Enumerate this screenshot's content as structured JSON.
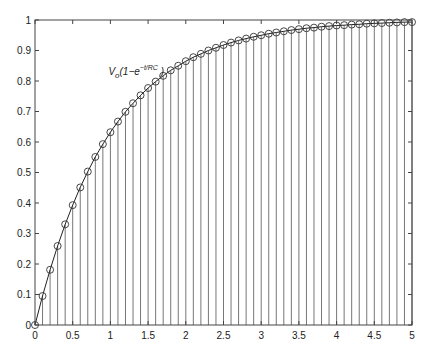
{
  "chart_data": {
    "type": "stem",
    "title": "",
    "xlabel": "",
    "ylabel": "",
    "xlim": [
      0,
      5
    ],
    "ylim": [
      0,
      1
    ],
    "grid": false,
    "legend": null,
    "x_ticks": [
      "0",
      "0.5",
      "1",
      "1.5",
      "2",
      "2.5",
      "3",
      "3.5",
      "4",
      "4.5",
      "5"
    ],
    "y_ticks": [
      "0",
      "0.1",
      "0.2",
      "0.3",
      "0.4",
      "0.5",
      "0.6",
      "0.7",
      "0.8",
      "0.9",
      "1"
    ],
    "annotation": {
      "base": "V",
      "sub": "o",
      "body": "(1−e",
      "sup": "−t/RC",
      "close": " )",
      "x": 1.0,
      "y": 0.82
    },
    "series": [
      {
        "name": "V_o(1-e^{-t/RC})",
        "style": "stem with circle markers and connecting line",
        "x": [
          0,
          0.1,
          0.2,
          0.3,
          0.4,
          0.5,
          0.6,
          0.7,
          0.8,
          0.9,
          1.0,
          1.1,
          1.2,
          1.3,
          1.4,
          1.5,
          1.6,
          1.7,
          1.8,
          1.9,
          2.0,
          2.1,
          2.2,
          2.3,
          2.4,
          2.5,
          2.6,
          2.7,
          2.8,
          2.9,
          3.0,
          3.1,
          3.2,
          3.3,
          3.4,
          3.5,
          3.6,
          3.7,
          3.8,
          3.9,
          4.0,
          4.1,
          4.2,
          4.3,
          4.4,
          4.5,
          4.6,
          4.7,
          4.8,
          4.9,
          5.0
        ],
        "values": [
          0.0,
          0.095,
          0.181,
          0.259,
          0.33,
          0.393,
          0.451,
          0.503,
          0.551,
          0.593,
          0.632,
          0.667,
          0.699,
          0.727,
          0.753,
          0.777,
          0.798,
          0.817,
          0.835,
          0.85,
          0.865,
          0.878,
          0.889,
          0.9,
          0.909,
          0.918,
          0.926,
          0.933,
          0.939,
          0.945,
          0.95,
          0.955,
          0.959,
          0.963,
          0.967,
          0.97,
          0.973,
          0.975,
          0.978,
          0.98,
          0.982,
          0.983,
          0.985,
          0.986,
          0.988,
          0.989,
          0.99,
          0.991,
          0.992,
          0.993,
          0.993
        ]
      }
    ]
  },
  "colors": {
    "axis": "#444444",
    "stem": "#777777",
    "marker": "#333333",
    "curve": "#222222"
  }
}
